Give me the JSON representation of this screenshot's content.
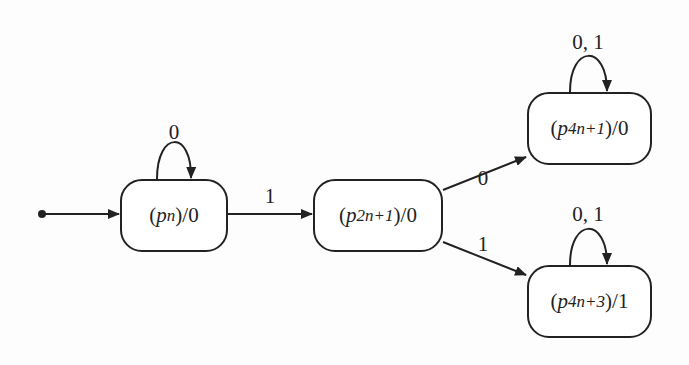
{
  "diagram": {
    "type": "moore-machine-state-diagram",
    "colors": {
      "stroke": "#222222",
      "background": "#fdfdfd",
      "node_fill": "#ffffff"
    },
    "nodes": [
      {
        "id": "pn",
        "paren_open": "(",
        "var": "p",
        "sub": "n",
        "suffix": ")/0",
        "x": 120,
        "y": 179,
        "w": 108,
        "h": 73
      },
      {
        "id": "p2n1",
        "paren_open": "(",
        "var": "p",
        "sub": "2n+1",
        "suffix": ")/0",
        "x": 313,
        "y": 179,
        "w": 130,
        "h": 73
      },
      {
        "id": "p4n1",
        "paren_open": "(",
        "var": "p",
        "sub": "4n+1",
        "suffix": ")/0",
        "x": 527,
        "y": 92,
        "w": 125,
        "h": 73
      },
      {
        "id": "p4n3",
        "paren_open": "(",
        "var": "p",
        "sub": "4n+3",
        "suffix": ")/1",
        "x": 527,
        "y": 265,
        "w": 125,
        "h": 73
      }
    ],
    "edges": [
      {
        "from": "start",
        "to": "pn",
        "label": ""
      },
      {
        "from": "pn",
        "to": "pn",
        "label": "0"
      },
      {
        "from": "pn",
        "to": "p2n1",
        "label": "1"
      },
      {
        "from": "p2n1",
        "to": "p4n1",
        "label": "0"
      },
      {
        "from": "p2n1",
        "to": "p4n3",
        "label": "1"
      },
      {
        "from": "p4n1",
        "to": "p4n1",
        "label": "0, 1"
      },
      {
        "from": "p4n3",
        "to": "p4n3",
        "label": "0, 1"
      }
    ]
  }
}
